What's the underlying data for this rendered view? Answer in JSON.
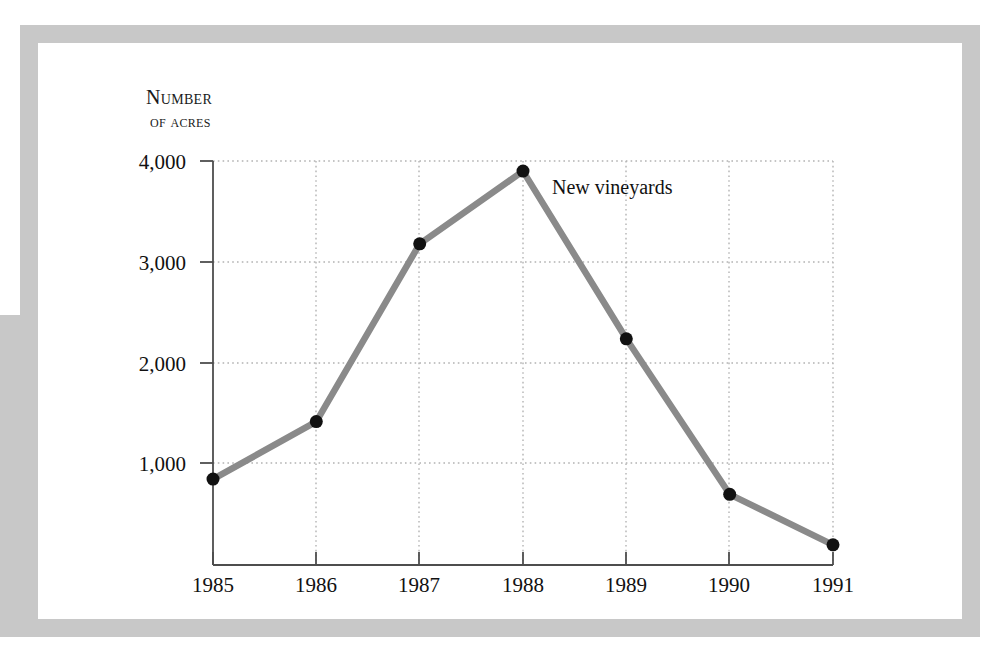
{
  "chart_data": {
    "type": "line",
    "title": "",
    "subtitle": "",
    "ylabel_line1": "Number",
    "ylabel_line2": "of acres",
    "xlabel": "",
    "categories": [
      "1985",
      "1986",
      "1987",
      "1988",
      "1989",
      "1990",
      "1991"
    ],
    "series": [
      {
        "name": "New vineyards",
        "values": [
          850,
          1420,
          3180,
          3900,
          2240,
          700,
          200
        ]
      }
    ],
    "annotations": [
      {
        "text": "New vineyards",
        "x": "1988",
        "y": 3550
      }
    ],
    "ytick_labels": [
      "1,000",
      "2,000",
      "3,000",
      "4,000"
    ],
    "ytick_values": [
      1000,
      2000,
      3000,
      4000
    ],
    "xtick_labels": [
      "1985",
      "1986",
      "1987",
      "1988",
      "1989",
      "1990",
      "1991"
    ],
    "ylim": [
      0,
      4000
    ],
    "grid": "dotted-both",
    "legend": "none",
    "line_color": "#8a8a8a",
    "marker_color": "#111111",
    "grid_color": "#b3b3b3",
    "axis_color": "#4d4d4d",
    "frame_color": "#c8c8c8",
    "background": "#ffffff"
  }
}
